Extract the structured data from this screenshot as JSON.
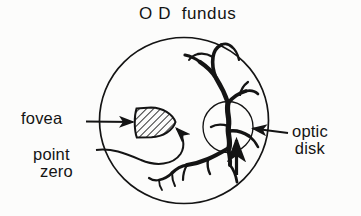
{
  "figure": {
    "title": "O D  fundus",
    "kind": "retinal-fundus-diagram",
    "background_color": "#fcfcfb",
    "ink_color": "#141414"
  },
  "labels": {
    "fovea": "fovea",
    "point_zero_line1": "point",
    "point_zero_line2": "zero",
    "optic_disk_line1": "optic",
    "optic_disk_line2": "disk"
  },
  "structures": {
    "fundus_outline": "large circle representing the right eye fundus",
    "optic_disk": "small circle at right of fundus",
    "fovea": "hatched wedge shape left of center",
    "vessels": "branching retinal blood vessels radiating from the optic disk"
  }
}
